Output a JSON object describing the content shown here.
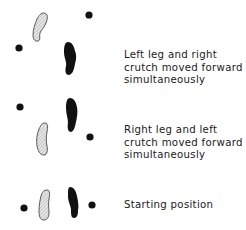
{
  "diagram": {
    "type": "crutch-gait-sequence",
    "steps": [
      {
        "label_lines": [
          "Left leg and right",
          "crutch moved forward",
          "simultaneously"
        ]
      },
      {
        "label_lines": [
          "Right leg and left",
          "crutch moved forward",
          "simultaneously"
        ]
      },
      {
        "label_lines": [
          "Starting position"
        ]
      }
    ],
    "legend": {
      "hatched_foot": "left foot",
      "black_foot": "right foot",
      "dot": "crutch tip"
    },
    "colors": {
      "ink": "#111111",
      "hatch_fill": "#d8d8d8"
    }
  }
}
